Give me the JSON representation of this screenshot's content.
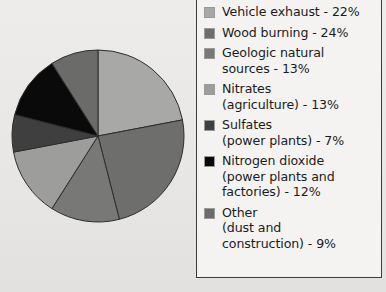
{
  "chart_data": {
    "type": "pie",
    "title": "",
    "subtitle": "",
    "xlabel": "",
    "ylabel": "",
    "legend_position": "right",
    "grid": false,
    "start_angle_deg": 0,
    "direction": "clockwise",
    "categories": [
      "Vehicle exhaust",
      "Wood burning",
      "Geologic natural sources",
      "Nitrates (agriculture)",
      "Sulfates (power plants)",
      "Nitrogen dioxide (power plants and factories)",
      "Other (dust and construction)"
    ],
    "values": [
      22,
      24,
      13,
      13,
      7,
      12,
      9
    ],
    "units": "%",
    "slices": [
      {
        "label": "Vehicle exhaust",
        "value": 22,
        "color": "#a8a8a6"
      },
      {
        "label": "Wood burning",
        "value": 24,
        "color": "#6e6e6c"
      },
      {
        "label": "Geologic natural sources",
        "value": 13,
        "color": "#787876"
      },
      {
        "label": "Nitrates (agriculture)",
        "value": 13,
        "color": "#9d9d9b"
      },
      {
        "label": "Sulfates (power plants)",
        "value": 7,
        "color": "#3f3f3f"
      },
      {
        "label": "Nitrogen dioxide (power plants and factories)",
        "value": 12,
        "color": "#0a0a0a"
      },
      {
        "label": "Other (dust and construction)",
        "value": 9,
        "color": "#6b6b69"
      }
    ]
  },
  "legend": {
    "items": [
      {
        "text": "Vehicle exhaust - 22%",
        "color": "#a8a8a6"
      },
      {
        "text": "Wood burning - 24%",
        "color": "#6e6e6c"
      },
      {
        "text": "Geologic natural\nsources - 13%",
        "color": "#787876"
      },
      {
        "text": "Nitrates\n(agriculture) - 13%",
        "color": "#9d9d9b"
      },
      {
        "text": "Sulfates\n(power plants) - 7%",
        "color": "#3f3f3f"
      },
      {
        "text": "Nitrogen dioxide\n(power plants and\nfactories) - 12%",
        "color": "#0a0a0a"
      },
      {
        "text": "Other\n(dust and\nconstruction) - 9%",
        "color": "#6b6b69"
      }
    ]
  },
  "style": {
    "background": "#e9e9e7",
    "legend_background": "#f4f3f1",
    "legend_border": "#3b3b3b",
    "slice_stroke": "#2d2d2d",
    "text_color": "#1c1c1c"
  }
}
